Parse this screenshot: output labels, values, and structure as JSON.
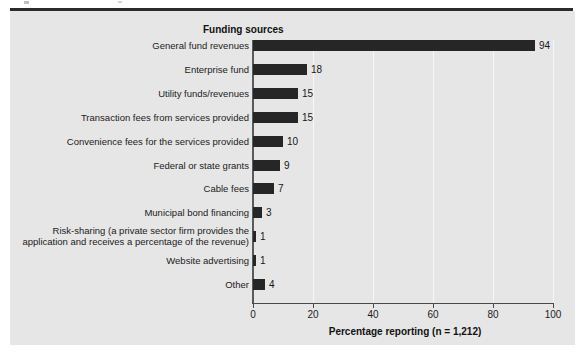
{
  "figure": {
    "column_header": "Funding sources",
    "background_color": "#e6e6e6",
    "bar_color": "#262626",
    "rule_color": "#2b2b2b"
  },
  "chart_data": {
    "type": "bar",
    "orientation": "horizontal",
    "title": "",
    "subtitle": "",
    "xlabel": "Percentage reporting (n = 1,212)",
    "ylabel": "Funding sources",
    "xlim": [
      0,
      100
    ],
    "grid": true,
    "legend": "none",
    "xticks": [
      "0",
      "20",
      "40",
      "60",
      "80",
      "100"
    ],
    "categories": [
      "General fund revenues",
      "Enterprise fund",
      "Utility funds/revenues",
      "Transaction fees from services provided",
      "Convenience fees for the services provided",
      "Federal or state grants",
      "Cable fees",
      "Municipal bond financing",
      "Risk-sharing (a private sector firm provides the application and receives a percentage of the revenue)",
      "Website advertising",
      "Other"
    ],
    "values": [
      94,
      18,
      15,
      15,
      10,
      9,
      7,
      3,
      1,
      1,
      4
    ],
    "value_labels": [
      "94",
      "18",
      "15",
      "15",
      "10",
      "9",
      "7",
      "3",
      "1",
      "1",
      "4"
    ]
  }
}
